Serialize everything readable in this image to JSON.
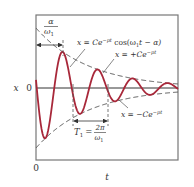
{
  "figure": {
    "axis_labels": {
      "y": "x",
      "x": "t",
      "y_zero": "0",
      "x_zero": "0"
    },
    "labels": {
      "curve": "x = Ce^{−pt} cos(ω₁t − α)",
      "curve_parts": {
        "prefix": "x = Ce",
        "exp": "−pt",
        "suffix": " cos(ω",
        "sub": "1",
        "tail": "t − α)"
      },
      "upper_envelope": {
        "prefix": "x = +Ce",
        "exp": "−pt"
      },
      "lower_envelope": {
        "prefix": "x = −Ce",
        "exp": "−pt"
      },
      "phase_offset": {
        "num": "α",
        "den": "ω",
        "den_sub": "1"
      },
      "period": {
        "lhs": "T",
        "lhs_sub": "1",
        "eq": "=",
        "num": "2π",
        "den": "ω",
        "den_sub": "1"
      }
    },
    "colors": {
      "curve": "#a8283a",
      "envelope": "#555555",
      "frame": "#777777",
      "axis": "#333333"
    }
  },
  "chart_data": {
    "type": "line",
    "title": "",
    "xlabel": "t",
    "ylabel": "x",
    "series": [
      {
        "name": "x = Ce^{-pt} cos(ω1 t − α)",
        "style": "solid",
        "color": "#a8283a"
      },
      {
        "name": "x = +Ce^{-pt}",
        "style": "dashed"
      },
      {
        "name": "x = −Ce^{-pt}",
        "style": "dashed"
      }
    ],
    "params_px": {
      "x0": 36,
      "y0": 88,
      "amplitude": 60,
      "decay": 0.019,
      "period": 35,
      "peak_t": 27,
      "t_max": 142
    },
    "annotations": [
      "α/ω1 (time to first peak)",
      "T1 = 2π/ω1 (period)"
    ],
    "grid": false
  }
}
